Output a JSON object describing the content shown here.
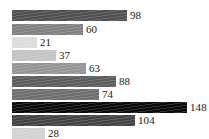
{
  "chart_data": {
    "type": "bar",
    "orientation": "horizontal",
    "title": "",
    "subtitle": "",
    "xlabel": "",
    "ylabel": "",
    "categories": [
      "",
      "",
      "",
      "",
      "",
      "",
      "",
      "",
      "",
      ""
    ],
    "values": [
      98,
      60,
      21,
      37,
      63,
      88,
      74,
      148,
      104,
      28
    ],
    "data_labels": [
      "98",
      "60",
      "21",
      "37",
      "63",
      "88",
      "74",
      "148",
      "104",
      "28"
    ],
    "bar_colors": [
      "#4f4f4f",
      "#808080",
      "#dcdcdc",
      "#c3c3c3",
      "#949494",
      "#5c5c5c",
      "#6e6e6e",
      "#0a0a0a",
      "#424242",
      "#d2d2d2"
    ],
    "xlim": [
      0,
      148
    ],
    "ylim": [
      0,
      10
    ],
    "grid": false,
    "axes_visible": false,
    "legend": null,
    "tick_labels_x": [],
    "tick_labels_y": [],
    "label_position": "outside-end",
    "background_color": "#ffffff",
    "label_color": "#1a1a1a"
  },
  "bars": [
    {
      "value": 98,
      "label": "98",
      "color": "#4f4f4f",
      "top": 9,
      "width": 115,
      "name": "bar-1"
    },
    {
      "value": 60,
      "label": "60",
      "color": "#808080",
      "top": 23,
      "width": 71,
      "name": "bar-2"
    },
    {
      "value": 21,
      "label": "21",
      "color": "#dcdcdc",
      "top": 36,
      "width": 25,
      "name": "bar-3"
    },
    {
      "value": 37,
      "label": "37",
      "color": "#c3c3c3",
      "top": 49,
      "width": 44,
      "name": "bar-4"
    },
    {
      "value": 63,
      "label": "63",
      "color": "#949494",
      "top": 62,
      "width": 74,
      "name": "bar-5"
    },
    {
      "value": 88,
      "label": "88",
      "color": "#5c5c5c",
      "top": 75,
      "width": 104,
      "name": "bar-6"
    },
    {
      "value": 74,
      "label": "74",
      "color": "#6e6e6e",
      "top": 88,
      "width": 87,
      "name": "bar-7"
    },
    {
      "value": 148,
      "label": "148",
      "color": "#0a0a0a",
      "top": 101,
      "width": 175,
      "name": "bar-8"
    },
    {
      "value": 104,
      "label": "104",
      "color": "#424242",
      "top": 114,
      "width": 123,
      "name": "bar-9"
    },
    {
      "value": 28,
      "label": "28",
      "color": "#d2d2d2",
      "top": 127,
      "width": 33,
      "name": "bar-10"
    }
  ]
}
